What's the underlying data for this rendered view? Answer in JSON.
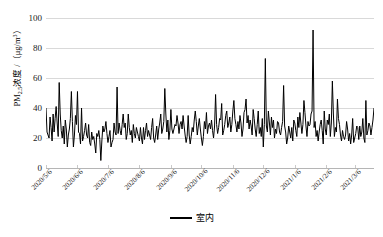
{
  "chart_data": {
    "type": "line",
    "title": "",
    "xlabel": "",
    "ylabel": "PM2.5浓度 /（μg/m³）",
    "ylabel_parts": {
      "prefix": "PM",
      "sub": "2.5",
      "mid": "浓度 /（μg/m",
      "sup": "3",
      "suffix": "）"
    },
    "ylim": [
      0,
      100
    ],
    "yticks": [
      0,
      20,
      40,
      60,
      80,
      100
    ],
    "ytick_labels": [
      "0",
      "20",
      "40",
      "60",
      "80",
      "100"
    ],
    "grid": true,
    "grid_color": "#d9d9d9",
    "legend_position": "bottom-center",
    "xtick_labels": [
      "2020/5/6",
      "2020/6/6",
      "2020/7/6",
      "2020/8/6",
      "2020/9/6",
      "2020/10/6",
      "2020/11/6",
      "2020/12/6",
      "2021/1/6",
      "2021/2/6",
      "2021/3/6"
    ],
    "xtick_index": [
      0,
      31,
      61,
      92,
      123,
      153,
      184,
      214,
      245,
      276,
      304
    ],
    "series": [
      {
        "name": "室内",
        "color": "#000000",
        "line_width": 1,
        "values": [
          40,
          24,
          22,
          20,
          34,
          27,
          18,
          36,
          24,
          33,
          41,
          30,
          21,
          57,
          36,
          25,
          20,
          28,
          16,
          32,
          26,
          14,
          22,
          26,
          33,
          51,
          31,
          14,
          22,
          35,
          29,
          51,
          24,
          23,
          16,
          40,
          18,
          21,
          25,
          30,
          22,
          20,
          29,
          17,
          15,
          24,
          19,
          21,
          16,
          10,
          23,
          21,
          25,
          19,
          5,
          18,
          28,
          24,
          26,
          31,
          23,
          17,
          21,
          25,
          14,
          17,
          19,
          30,
          24,
          22,
          54,
          23,
          30,
          25,
          22,
          29,
          36,
          27,
          30,
          19,
          23,
          36,
          27,
          22,
          25,
          17,
          29,
          23,
          20,
          27,
          24,
          21,
          18,
          27,
          20,
          16,
          27,
          19,
          25,
          30,
          21,
          25,
          22,
          19,
          27,
          33,
          20,
          17,
          22,
          28,
          19,
          26,
          30,
          36,
          23,
          26,
          31,
          53,
          36,
          24,
          32,
          19,
          25,
          39,
          26,
          23,
          26,
          29,
          28,
          35,
          30,
          23,
          29,
          31,
          26,
          35,
          28,
          22,
          17,
          21,
          35,
          22,
          16,
          21,
          27,
          24,
          32,
          38,
          31,
          22,
          28,
          33,
          26,
          20,
          15,
          21,
          31,
          26,
          37,
          23,
          28,
          30,
          26,
          32,
          25,
          20,
          28,
          49,
          29,
          23,
          27,
          33,
          32,
          43,
          22,
          25,
          29,
          35,
          38,
          27,
          30,
          34,
          24,
          29,
          38,
          45,
          33,
          29,
          24,
          31,
          26,
          35,
          30,
          21,
          26,
          37,
          39,
          46,
          30,
          35,
          26,
          32,
          28,
          22,
          39,
          33,
          26,
          21,
          29,
          38,
          23,
          27,
          21,
          33,
          14,
          29,
          73,
          28,
          24,
          38,
          30,
          22,
          34,
          27,
          32,
          20,
          26,
          23,
          31,
          30,
          24,
          22,
          27,
          31,
          55,
          28,
          24,
          16,
          20,
          28,
          24,
          20,
          27,
          18,
          32,
          30,
          25,
          21,
          34,
          27,
          37,
          30,
          23,
          29,
          45,
          37,
          28,
          21,
          31,
          28,
          29,
          36,
          38,
          92,
          27,
          31,
          21,
          25,
          18,
          24,
          29,
          32,
          25,
          16,
          38,
          26,
          22,
          32,
          29,
          36,
          21,
          30,
          58,
          36,
          21,
          27,
          24,
          46,
          33,
          29,
          22,
          18,
          25,
          21,
          19,
          22,
          31,
          26,
          18,
          23,
          16,
          22,
          33,
          17,
          20,
          23,
          28,
          27,
          19,
          28,
          21,
          24,
          33,
          20,
          17,
          45,
          22,
          25,
          30,
          28,
          22,
          27,
          32,
          40
        ]
      }
    ]
  },
  "legend": {
    "label": "室内"
  }
}
